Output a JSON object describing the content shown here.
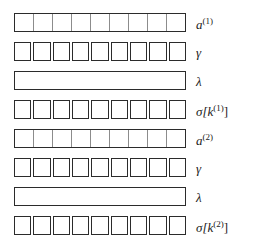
{
  "figure": {
    "num_rows": 8,
    "cells_per_row": 9,
    "colors": {
      "outline": "#2b2b2b",
      "divider": "#8c8c8c",
      "fill": "#ffffff",
      "background": "#ffffff",
      "label": "#1a1a1a"
    },
    "rows": [
      {
        "label_base": "a",
        "label_sup": "(1)",
        "label_suffix": "",
        "label_text": "a(1)",
        "style": "segmented",
        "cells": 9,
        "top": 13
      },
      {
        "label_base": "γ",
        "label_sup": "",
        "label_suffix": "",
        "label_text": "γ",
        "style": "squares",
        "cells": 9,
        "top": 42
      },
      {
        "label_base": "λ",
        "label_sup": "",
        "label_suffix": "",
        "label_text": "λ",
        "style": "plain",
        "cells": 1,
        "top": 71
      },
      {
        "label_base": "σ[k",
        "label_sup": "(1)",
        "label_suffix": "]",
        "label_text": "σ[k(1)]",
        "style": "squares",
        "cells": 9,
        "top": 100
      },
      {
        "label_base": "a",
        "label_sup": "(2)",
        "label_suffix": "",
        "label_text": "a(2)",
        "style": "segmented",
        "cells": 9,
        "top": 129
      },
      {
        "label_base": "γ",
        "label_sup": "",
        "label_suffix": "",
        "label_text": "γ",
        "style": "squares",
        "cells": 9,
        "top": 158
      },
      {
        "label_base": "λ",
        "label_sup": "",
        "label_suffix": "",
        "label_text": "λ",
        "style": "plain",
        "cells": 1,
        "top": 187
      },
      {
        "label_base": "σ[k",
        "label_sup": "(2)",
        "label_suffix": "]",
        "label_text": "σ[k(2)]",
        "style": "squares",
        "cells": 9,
        "top": 216
      }
    ]
  }
}
